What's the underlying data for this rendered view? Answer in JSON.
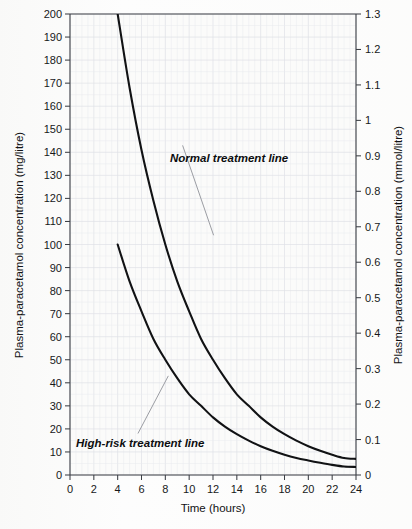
{
  "chart_data": {
    "type": "line",
    "title": "",
    "subtitle": "",
    "xlabel": "Time (hours)",
    "ylabel": "Plasma-paracetamol concentration (mg/litre)",
    "ylabel_right": "Plasma-paracetamol concentration (mmol/litre)",
    "xlim": [
      0,
      24
    ],
    "ylim": [
      0,
      200
    ],
    "ylim_right": [
      0,
      1.3
    ],
    "grid": true,
    "grid_style": "graph-paper",
    "legend": "none",
    "legend_position": "inline-annotations",
    "xticks": [
      0,
      2,
      4,
      6,
      8,
      10,
      12,
      14,
      16,
      18,
      20,
      22,
      24
    ],
    "xtick_labels": [
      "0",
      "2",
      "4",
      "6",
      "8",
      "10",
      "12",
      "14",
      "16",
      "18",
      "20",
      "22",
      "24"
    ],
    "yticks": [
      0,
      10,
      20,
      30,
      40,
      50,
      60,
      70,
      80,
      90,
      100,
      110,
      120,
      130,
      140,
      150,
      160,
      170,
      180,
      190,
      200
    ],
    "ytick_labels": [
      "0",
      "10",
      "20",
      "30",
      "40",
      "50",
      "60",
      "70",
      "80",
      "90",
      "100",
      "110",
      "120",
      "130",
      "140",
      "150",
      "160",
      "170",
      "180",
      "190",
      "200"
    ],
    "yticks_right": [
      0,
      0.1,
      0.2,
      0.3,
      0.4,
      0.5,
      0.6,
      0.7,
      0.8,
      0.9,
      1.0,
      1.1,
      1.2,
      1.3
    ],
    "ytick_labels_right": [
      "0",
      "0.1",
      "0.2",
      "0.3",
      "0.4",
      "0.5",
      "0.6",
      "0.7",
      "0.8",
      "0.9",
      "1",
      "1.1",
      "1.2",
      "1.3"
    ],
    "x": [
      4,
      5,
      6,
      7,
      8,
      9,
      10,
      11,
      12,
      13,
      14,
      15,
      16,
      17,
      18,
      19,
      20,
      21,
      22,
      23,
      24
    ],
    "series": [
      {
        "name": "Normal treatment line",
        "values": [
          200,
          168,
          141,
          119,
          100,
          84,
          71,
          59,
          50,
          42,
          35,
          30,
          25,
          21,
          17.7,
          14.9,
          12.5,
          10.5,
          8.8,
          7.4,
          7.0
        ]
      },
      {
        "name": "High-risk treatment line",
        "values": [
          100,
          84,
          71,
          59,
          50,
          42,
          35,
          30,
          25,
          21,
          17.7,
          14.9,
          12.5,
          10.5,
          8.8,
          7.4,
          6.3,
          5.3,
          4.4,
          3.7,
          3.5
        ]
      }
    ],
    "annotations": [
      {
        "label": "Normal treatment line",
        "leader_from": [
          12.05,
          104
        ],
        "leader_to": [
          9.45,
          143
        ]
      },
      {
        "label": "High-risk treatment line",
        "leader_from": [
          5.7,
          18
        ],
        "leader_to": [
          8.25,
          43
        ]
      }
    ]
  },
  "axes": {
    "left_title": "Plasma-paracetamol concentration (mg/litre)",
    "right_title": "Plasma-paracetamol concentration (mmol/litre)",
    "bottom_title": "Time (hours)"
  }
}
